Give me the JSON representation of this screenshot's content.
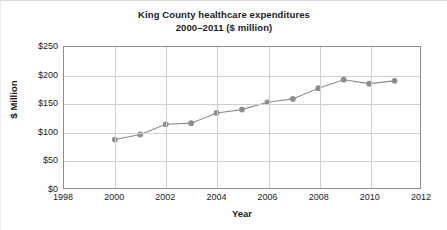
{
  "chart_data": {
    "type": "line",
    "title": "King County healthcare expenditures",
    "subtitle": "2000–2011 ($ million)",
    "xlabel": "Year",
    "ylabel": "$ Million",
    "xlim": [
      1998,
      2012
    ],
    "ylim": [
      0,
      250
    ],
    "grid": true,
    "legend": "none",
    "xticks": [
      "1998",
      "2000",
      "2002",
      "2004",
      "2006",
      "2008",
      "2010",
      "2012"
    ],
    "xtick_values": [
      1998,
      2000,
      2002,
      2004,
      2006,
      2008,
      2010,
      2012
    ],
    "yticks": [
      "$0",
      "$50",
      "$100",
      "$150",
      "$200",
      "$250"
    ],
    "ytick_values": [
      0,
      50,
      100,
      150,
      200,
      250
    ],
    "x": [
      2000,
      2001,
      2002,
      2003,
      2004,
      2005,
      2006,
      2007,
      2008,
      2009,
      2010,
      2011
    ],
    "values": [
      86,
      95,
      113,
      115,
      133,
      139,
      152,
      158,
      177,
      192,
      185,
      190
    ],
    "series": [
      {
        "name": "King County healthcare expenditures",
        "values": [
          86,
          95,
          113,
          115,
          133,
          139,
          152,
          158,
          177,
          192,
          185,
          190
        ]
      }
    ],
    "marker": "circle",
    "line_color": "#8d8d8d",
    "marker_color": "#8d8d8d",
    "grid_color": "#cfcfcf",
    "axis_color": "#8c8c8c",
    "text_color": "#1b1b1b"
  }
}
